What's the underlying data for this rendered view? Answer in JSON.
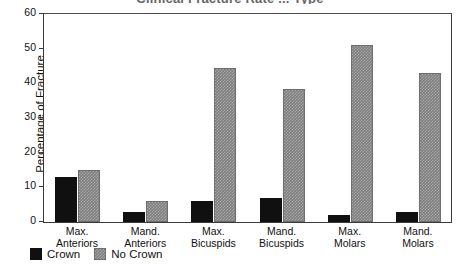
{
  "chart_data": {
    "type": "bar",
    "title": "Clinical Fracture Rate ... Type",
    "xlabel": "",
    "ylabel": "Percentage of Fracture",
    "ylim": [
      0,
      60
    ],
    "yticks": [
      0,
      10,
      20,
      30,
      40,
      50,
      60
    ],
    "grid": false,
    "legend_position": "below-axis-left",
    "categories": [
      "Max. Anteriors",
      "Mand. Anteriors",
      "Max. Bicuspids",
      "Mand. Bicuspids",
      "Max. Molars",
      "Mand. Molars"
    ],
    "category_lines": [
      [
        "Max.",
        "Anteriors"
      ],
      [
        "Mand.",
        "Anteriors"
      ],
      [
        "Max.",
        "Bicuspids"
      ],
      [
        "Mand.",
        "Bicuspids"
      ],
      [
        "Max.",
        "Molars"
      ],
      [
        "Mand.",
        "Molars"
      ]
    ],
    "series": [
      {
        "name": "Crown",
        "color": "#101010",
        "values": [
          13,
          3,
          6,
          7,
          2,
          3
        ]
      },
      {
        "name": "No Crown",
        "color": "#7d7d7d",
        "values": [
          15,
          6,
          44,
          38,
          50.5,
          42.5
        ]
      }
    ]
  },
  "legend": {
    "items": [
      {
        "label": "Crown"
      },
      {
        "label": "No Crown"
      }
    ]
  }
}
